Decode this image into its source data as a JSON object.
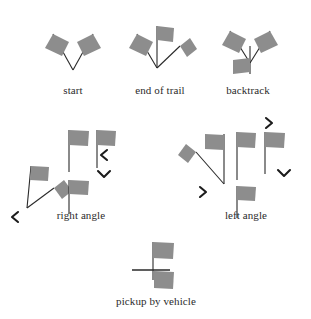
{
  "diagram": {
    "background_color": "#ffffff",
    "flag_color": "#8d8d8d",
    "pole_color": "#2a2a2a",
    "arrow_color": "#1c1c1c"
  },
  "symbols": [
    {
      "id": "start",
      "label": "start",
      "description": "two flags forming a V from a common bottom vertex",
      "flag_count": 2,
      "arrows": []
    },
    {
      "id": "end-of-trail",
      "label": "end of trail",
      "description": "three flags from a common bottom vertex: left, vertical, right",
      "flag_count": 3,
      "arrows": []
    },
    {
      "id": "backtrack",
      "label": "backtrack",
      "description": "two flags in a V plus a downward pole with a flag at the bottom",
      "flag_count": 3,
      "arrows": []
    },
    {
      "id": "right-angle-a",
      "label": "right angle",
      "description": "vertical pole with flag and a diagonal pole with flag to the upper right",
      "flag_count": 2,
      "arrows": [
        "chevron-left"
      ]
    },
    {
      "id": "right-angle-b",
      "label": "",
      "description": "three vertical flag poles with right-pointing flags",
      "flag_count": 3,
      "arrows": [
        "chevron-left",
        "chevron-down"
      ]
    },
    {
      "id": "left-angle-a",
      "label": "left angle",
      "description": "vertical pole with flag and a diagonal pole with flag to the upper left",
      "flag_count": 2,
      "arrows": [
        "chevron-right"
      ]
    },
    {
      "id": "left-angle-b",
      "label": "",
      "description": "three vertical flag poles with right-pointing flags",
      "flag_count": 3,
      "arrows": [
        "chevron-right",
        "chevron-down"
      ]
    },
    {
      "id": "pickup-by-vehicle",
      "label": "pickup by vehicle",
      "description": "vertical pole with flag, horizontal bar, and flag below",
      "flag_count": 2,
      "arrows": []
    }
  ],
  "captions": {
    "start": "start",
    "end_of_trail": "end of trail",
    "backtrack": "backtrack",
    "right_angle": "right angle",
    "left_angle": "left angle",
    "pickup_by_vehicle": "pickup by vehicle"
  }
}
